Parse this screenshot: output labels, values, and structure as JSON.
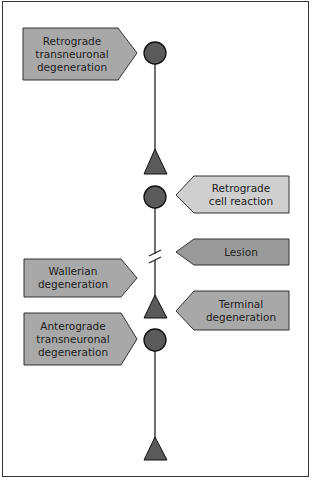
{
  "diagram": {
    "title": "",
    "colors": {
      "frame": "#333333",
      "axon_line": "#222222",
      "node_fill": "#5a5a5a",
      "node_stroke": "#111111",
      "label_medium": "#a8a8a8",
      "label_light": "#cfcfcf",
      "label_dark": "#9a9a9a",
      "label_stroke": "#333333"
    },
    "labels": {
      "retrograde_transneuronal": "Retrograde transneuronal degeneration",
      "retrograde_cell_reaction": "Retrograde cell reaction",
      "lesion": "Lesion",
      "wallerian": "Wallerian degeneration",
      "terminal": "Terminal degeneration",
      "anterograde_transneuronal": "Anterograde transneuronal degeneration"
    },
    "label_lines": {
      "retrograde_transneuronal": [
        "Retrograde",
        "transneuronal",
        "degeneration"
      ],
      "retrograde_cell_reaction": [
        "Retrograde",
        "cell reaction"
      ],
      "lesion": [
        "Lesion"
      ],
      "wallerian": [
        "Wallerian",
        "degeneration"
      ],
      "terminal": [
        "Terminal",
        "degeneration"
      ],
      "anterograde_transneuronal": [
        "Anterograde",
        "transneuronal",
        "degeneration"
      ]
    },
    "nodes": [
      {
        "type": "cell-body",
        "y": 53
      },
      {
        "type": "terminal",
        "y": 161
      },
      {
        "type": "cell-body",
        "y": 197
      },
      {
        "type": "lesion-break",
        "y": 257
      },
      {
        "type": "terminal",
        "y": 307
      },
      {
        "type": "cell-body",
        "y": 340
      },
      {
        "type": "terminal",
        "y": 449
      }
    ]
  }
}
